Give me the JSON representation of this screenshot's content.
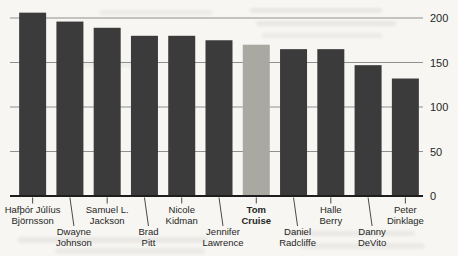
{
  "chart_data": {
    "type": "bar",
    "title": "",
    "xlabel": "",
    "ylabel": "",
    "categories": [
      "Hafþór Júlíus Björnsson",
      "Dwayne Johnson",
      "Samuel L. Jackson",
      "Brad Pitt",
      "Nicole Kidman",
      "Jennifer Lawrence",
      "Tom Cruise",
      "Daniel Radcliffe",
      "Halle Berry",
      "Danny DeVito",
      "Peter Dinklage"
    ],
    "tick_label_lines": [
      [
        "Hafþór Júlíus",
        "Björnsson"
      ],
      [
        "Dwayne",
        "Johnson"
      ],
      [
        "Samuel L.",
        "Jackson"
      ],
      [
        "Brad",
        "Pitt"
      ],
      [
        "Nicole",
        "Kidman"
      ],
      [
        "Jennifer",
        "Lawrence"
      ],
      [
        "Tom",
        "Cruise"
      ],
      [
        "Daniel",
        "Radcliffe"
      ],
      [
        "Halle",
        "Berry"
      ],
      [
        "Danny",
        "DeVito"
      ],
      [
        "Peter",
        "Dinklage"
      ]
    ],
    "values": [
      206,
      196,
      189,
      180,
      180,
      175,
      170,
      165,
      165,
      147,
      132
    ],
    "highlighted_category": "Tom Cruise",
    "ylim": [
      0,
      200
    ],
    "yticks": [
      0,
      50,
      100,
      150,
      200
    ],
    "ytick_labels": [
      "0",
      "50",
      "100",
      "150",
      "200"
    ],
    "y_axis_side": "right",
    "grid": true,
    "legend": false,
    "bar_color": "#3b3b3b",
    "highlight_color": "#a9a9a2",
    "gridline_color": "#909090",
    "axis_line_color": "#1e1e1e",
    "text_color": "#262626",
    "background_color": "#f7f6f2"
  }
}
